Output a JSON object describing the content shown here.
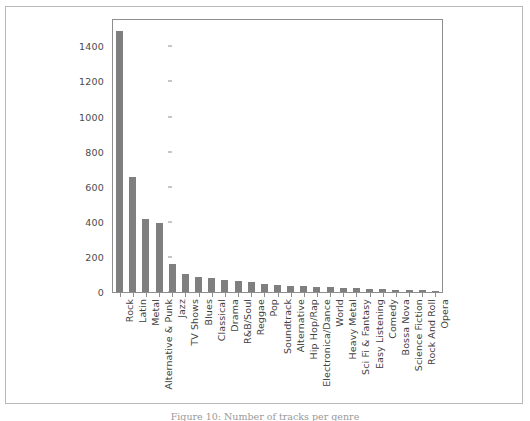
{
  "figure": {
    "caption": "Figure 10: Number of tracks per genre"
  },
  "chart_data": {
    "type": "bar",
    "title": "",
    "xlabel": "",
    "ylabel": "",
    "ylim": [
      0,
      1550
    ],
    "grid": false,
    "legend": null,
    "bar_color": "#7f7f7f",
    "axis_color": "#8e8e8e",
    "tick_label_color": "#4a4a4a",
    "yticks": [
      0,
      200,
      400,
      600,
      800,
      1000,
      1200,
      1400
    ],
    "ytick_labels": [
      "0",
      "200",
      "400",
      "600",
      "800",
      "1000",
      "1200",
      "1400"
    ],
    "categories": [
      "Rock",
      "Latin",
      "Metal",
      "Alternative & Punk",
      "Jazz",
      "TV Shows",
      "Blues",
      "Classical",
      "Drama",
      "R&B/Soul",
      "Reggae",
      "Pop",
      "Soundtrack",
      "Alternative",
      "Hip Hop/Rap",
      "Electronica/Dance",
      "World",
      "Heavy Metal",
      "Sci Fi & Fantasy",
      "Easy Listening",
      "Comedy",
      "Bossa Nova",
      "Science Fiction",
      "Rock And Roll",
      "Opera"
    ],
    "values": [
      1490,
      654,
      418,
      391,
      158,
      100,
      87,
      80,
      66,
      62,
      55,
      44,
      42,
      36,
      33,
      29,
      27,
      24,
      22,
      20,
      15,
      13,
      12,
      10,
      2
    ]
  }
}
